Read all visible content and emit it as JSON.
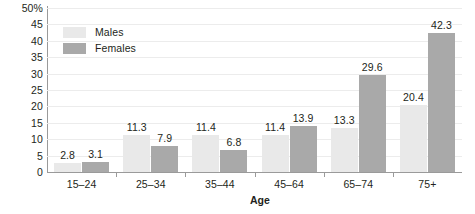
{
  "chart_data": {
    "type": "bar",
    "title": "",
    "subtitle": "",
    "xlabel": "Age",
    "ylabel": "",
    "ylim": [
      0,
      50
    ],
    "y_unit": "%",
    "grid": true,
    "legend_position": "top-left-inside",
    "categories": [
      "15–24",
      "25–34",
      "35–44",
      "45–64",
      "65–74",
      "75+"
    ],
    "y_ticks": [
      "50%",
      "45",
      "40",
      "35",
      "30",
      "25",
      "20",
      "15",
      "10",
      "5",
      "0"
    ],
    "y_tick_values": [
      50,
      45,
      40,
      35,
      30,
      25,
      20,
      15,
      10,
      5,
      0
    ],
    "series": [
      {
        "name": "Males",
        "color": "#e9e9e9",
        "values": [
          2.8,
          11.3,
          11.4,
          11.4,
          13.3,
          20.4
        ],
        "labels": [
          "2.8",
          "11.3",
          "11.4",
          "11.4",
          "13.3",
          "20.4"
        ]
      },
      {
        "name": "Females",
        "color": "#a9a9a9",
        "values": [
          3.1,
          7.9,
          6.8,
          13.9,
          29.6,
          42.3
        ],
        "labels": [
          "3.1",
          "7.9",
          "6.8",
          "13.9",
          "29.6",
          "42.3"
        ]
      }
    ]
  },
  "legend": {
    "items": [
      {
        "label": "Males",
        "color": "#e9e9e9"
      },
      {
        "label": "Females",
        "color": "#a9a9a9"
      }
    ]
  },
  "axis": {
    "x_title": "Age"
  },
  "colors": {
    "male_bar": "#e9e9e9",
    "female_bar": "#a9a9a9",
    "axis_line": "#9a9a9a",
    "gridline": "#ececec",
    "text": "#231f20",
    "background": "#ffffff"
  }
}
